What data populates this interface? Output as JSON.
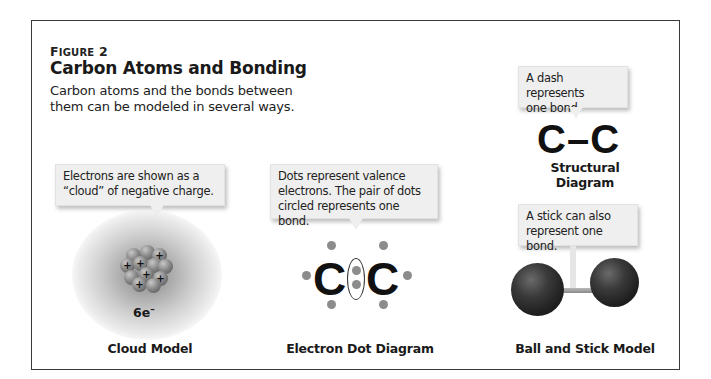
{
  "figure": {
    "label_prefix": "F",
    "label_rest": "IGURE",
    "label_number": "2",
    "title": "Carbon Atoms and Bonding",
    "caption_line1": "Carbon atoms and the bonds between",
    "caption_line2": "them can be modeled in several ways."
  },
  "models": {
    "cloud": {
      "callout_line1": "Electrons are shown as a",
      "callout_line2": "“cloud” of negative charge.",
      "electron_count": "6e",
      "electron_sign": "–",
      "nucleus_sign": "+",
      "label": "Cloud Model"
    },
    "electron_dot": {
      "callout_line1": "Dots represent valence",
      "callout_line2": "electrons. The pair of dots",
      "callout_line3": "circled represents one bond.",
      "atom_left": "C",
      "atom_right": "C",
      "label": "Electron Dot Diagram"
    },
    "structural": {
      "callout_line1": "A dash represents",
      "callout_line2": "one bond.",
      "formula": "C–C",
      "label": "Structural Diagram"
    },
    "ball_and_stick": {
      "callout_line1": "A stick can also",
      "callout_line2": "represent one bond.",
      "label": "Ball and Stick Model"
    }
  },
  "colors": {
    "border": "#3a3a3a",
    "callout_bg": "#efefef",
    "dot": "#8c8c8c",
    "ball": "#2a2a2a"
  }
}
